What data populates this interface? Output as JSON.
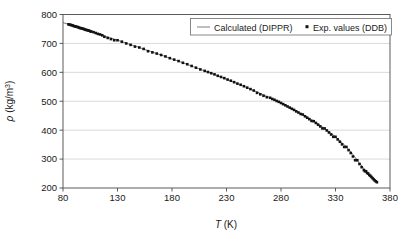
{
  "chart_data": {
    "type": "line",
    "title": "",
    "xlabel": "T (K)",
    "ylabel": "ρ (kg/m³)",
    "xlabel_symbol": "T",
    "xlabel_unit": "(K)",
    "ylabel_symbol": "ρ",
    "ylabel_unit": "(kg/m",
    "ylabel_exponent": "3",
    "ylabel_unit_close": ")",
    "xlim": [
      80,
      380
    ],
    "ylim": [
      200,
      800
    ],
    "xticks": [
      80,
      130,
      180,
      230,
      280,
      330,
      380
    ],
    "yticks": [
      200,
      300,
      400,
      500,
      600,
      700,
      800
    ],
    "xtick_labels": [
      "80",
      "130",
      "180",
      "230",
      "280",
      "330",
      "380"
    ],
    "ytick_labels": [
      "200",
      "300",
      "400",
      "500",
      "600",
      "700",
      "800"
    ],
    "grid": "horizontal",
    "legend_position": "top-right",
    "series": [
      {
        "name": "Calculated (DIPPR)",
        "type": "line",
        "marker": "none",
        "color": "#6b6b6b",
        "x": [
          80,
          85,
          90,
          95,
          100,
          105,
          110,
          115,
          120,
          125,
          130,
          135,
          140,
          145,
          150,
          155,
          160,
          165,
          170,
          175,
          180,
          185,
          190,
          195,
          200,
          205,
          210,
          215,
          220,
          225,
          230,
          235,
          240,
          245,
          250,
          255,
          260,
          265,
          270,
          275,
          280,
          285,
          290,
          295,
          300,
          305,
          310,
          315,
          320,
          325,
          330,
          335,
          340,
          345,
          350,
          355,
          358,
          360,
          362,
          363,
          364,
          365,
          365.5,
          366,
          366.5,
          367,
          367.5,
          368,
          368.5,
          369
        ],
        "y": [
          772,
          766,
          760,
          754,
          748,
          742,
          736,
          730,
          723,
          717,
          711,
          705,
          698,
          692,
          686,
          679,
          673,
          666,
          660,
          653,
          646,
          640,
          633,
          626,
          619,
          612,
          605,
          598,
          591,
          583,
          576,
          568,
          561,
          553,
          545,
          537,
          529,
          520,
          512,
          503,
          494,
          484,
          474,
          464,
          454,
          443,
          431,
          419,
          406,
          392,
          377,
          360,
          342,
          321,
          296,
          272,
          258,
          250,
          242,
          238,
          234,
          230,
          228,
          226,
          225,
          224,
          223,
          222,
          221,
          220
        ]
      },
      {
        "name": "Exp. values (DDB)",
        "type": "scatter",
        "marker": "square",
        "color": "#121212",
        "x": [
          85,
          86,
          87,
          88,
          89,
          90,
          91,
          92,
          93,
          94,
          95,
          96,
          97,
          98,
          99,
          100,
          101,
          102,
          103,
          104,
          105,
          106,
          108,
          110,
          112,
          114,
          116,
          118,
          121,
          124,
          127,
          130,
          134,
          138,
          142,
          146,
          150,
          154,
          158,
          162,
          166,
          170,
          174,
          178,
          182,
          186,
          190,
          194,
          198,
          202,
          206,
          210,
          213,
          216,
          219,
          222,
          225,
          228,
          231,
          234,
          237,
          240,
          243,
          246,
          249,
          252,
          255,
          258,
          261,
          264,
          267,
          270,
          272,
          274,
          276,
          278,
          280,
          282,
          284,
          286,
          288,
          290,
          292,
          294,
          296,
          298,
          300,
          302,
          304,
          306,
          308,
          310,
          312,
          314,
          316,
          318,
          320,
          322,
          324,
          326,
          328,
          330,
          332,
          334,
          336,
          338,
          340,
          342,
          344,
          346,
          348,
          350,
          352,
          354,
          356,
          357,
          358,
          359,
          360,
          361,
          362,
          363,
          364,
          365,
          366,
          367,
          368
        ],
        "y": [
          766,
          765,
          764,
          763,
          762,
          760,
          759,
          758,
          757,
          756,
          754,
          753,
          752,
          751,
          750,
          748,
          747,
          746,
          745,
          744,
          742,
          741,
          739,
          736,
          733,
          731,
          728,
          723,
          719,
          715,
          711,
          711,
          706,
          700,
          695,
          689,
          686,
          681,
          673,
          669,
          665,
          660,
          655,
          649,
          644,
          639,
          633,
          628,
          622,
          616,
          610,
          605,
          601,
          597,
          593,
          588,
          584,
          580,
          575,
          571,
          566,
          561,
          557,
          552,
          547,
          542,
          537,
          529,
          524,
          519,
          514,
          512,
          508,
          505,
          501,
          498,
          494,
          490,
          486,
          482,
          478,
          474,
          470,
          465,
          461,
          456,
          454,
          448,
          443,
          438,
          432,
          431,
          425,
          419,
          413,
          406,
          406,
          399,
          392,
          385,
          377,
          377,
          368,
          360,
          351,
          342,
          342,
          331,
          321,
          309,
          296,
          296,
          283,
          272,
          262,
          258,
          258,
          252,
          250,
          245,
          242,
          238,
          234,
          230,
          226,
          223,
          220
        ]
      }
    ],
    "legend": [
      {
        "label": "Calculated (DIPPR)",
        "marker": "line",
        "color": "#6b6b6b"
      },
      {
        "label": "Exp. values (DDB)",
        "marker": "square",
        "color": "#121212"
      }
    ]
  }
}
